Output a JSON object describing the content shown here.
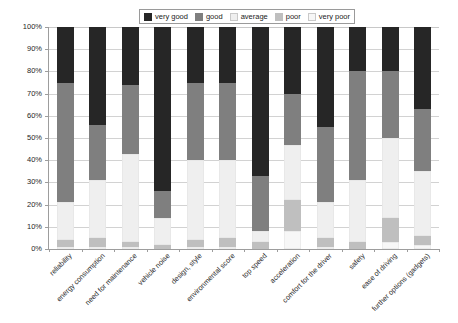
{
  "chart_data": {
    "type": "bar",
    "subtype": "stacked-bar-100-percent",
    "title": "",
    "xlabel": "",
    "ylabel": "",
    "ylim": [
      0,
      100
    ],
    "ytick_labels": [
      "0%",
      "10%",
      "20%",
      "30%",
      "40%",
      "50%",
      "60%",
      "70%",
      "80%",
      "90%",
      "100%"
    ],
    "ytick_values": [
      0,
      10,
      20,
      30,
      40,
      50,
      60,
      70,
      80,
      90,
      100
    ],
    "grid": true,
    "legend_position": "top-center",
    "stack_order_bottom_to_top": [
      "very poor",
      "poor",
      "average",
      "good",
      "very good"
    ],
    "categories": [
      "reliability",
      "energy consumption",
      "need for maintenance",
      "vehicle noise",
      "design, style",
      "environmental score",
      "top speed",
      "acceleration",
      "comfort for the driver",
      "safety",
      "ease of driving",
      "further options (gadgets)"
    ],
    "series": [
      {
        "name": "very good",
        "color": "#262626",
        "values": [
          25,
          44,
          26,
          74,
          25,
          25,
          67,
          30,
          45,
          20,
          20,
          37
        ]
      },
      {
        "name": "good",
        "color": "#7f7f7f",
        "values": [
          54,
          25,
          31,
          12,
          35,
          35,
          25,
          23,
          34,
          49,
          30,
          28
        ]
      },
      {
        "name": "average",
        "color": "#efefef",
        "values": [
          17,
          26,
          40,
          12,
          36,
          35,
          5,
          25,
          16,
          28,
          36,
          29
        ]
      },
      {
        "name": "poor",
        "color": "#bfbfbf",
        "values": [
          3,
          4,
          2,
          2,
          3,
          4,
          3,
          14,
          4,
          3,
          11,
          4
        ]
      },
      {
        "name": "very poor",
        "color": "#f7f7f7",
        "values": [
          1,
          1,
          1,
          0,
          1,
          1,
          0,
          8,
          1,
          0,
          3,
          2
        ]
      }
    ]
  },
  "legend": {
    "items": [
      {
        "label": "very good",
        "color": "#262626"
      },
      {
        "label": "good",
        "color": "#7f7f7f"
      },
      {
        "label": "average",
        "color": "#efefef"
      },
      {
        "label": "poor",
        "color": "#bfbfbf"
      },
      {
        "label": "very poor",
        "color": "#f7f7f7"
      }
    ]
  }
}
